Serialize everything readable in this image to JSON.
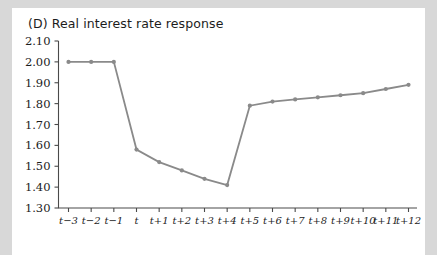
{
  "panel": {
    "label": "(D)",
    "title": "(D) Real interest rate response"
  },
  "colors": {
    "series": "#8a8a8a",
    "axis": "#4a4a4a",
    "text": "#1c1c1c",
    "plot_background": "#ffffff",
    "page_background": "#d8d8d8"
  },
  "chart_data": {
    "type": "line",
    "title": "(D) Real interest rate response",
    "xlabel": "",
    "ylabel": "",
    "grid": false,
    "legend": "none",
    "marker": "circle",
    "series_color": "#8a8a8a",
    "categories": [
      "t−3",
      "t−2",
      "t−1",
      "t",
      "t+1",
      "t+2",
      "t+3",
      "t+4",
      "t+5",
      "t+6",
      "t+7",
      "t+8",
      "t+9",
      "t+10",
      "t+11",
      "t+12"
    ],
    "values": [
      2.0,
      2.0,
      2.0,
      1.58,
      1.52,
      1.48,
      1.44,
      1.41,
      1.79,
      1.81,
      1.82,
      1.83,
      1.84,
      1.85,
      1.87,
      1.89
    ],
    "ylim": [
      1.3,
      2.1
    ],
    "ytick_labels": [
      "2.10",
      "2.00",
      "1.90",
      "1.80",
      "1.70",
      "1.60",
      "1.50",
      "1.40",
      "1.30"
    ],
    "ytick_values": [
      2.1,
      2.0,
      1.9,
      1.8,
      1.7,
      1.6,
      1.5,
      1.4,
      1.3
    ],
    "xtick_labels": [
      "t−3",
      "t−2",
      "t−1",
      "t",
      "t+1",
      "t+2",
      "t+3",
      "t+4",
      "t+5",
      "t+6",
      "t+7",
      "t+8",
      "t+9",
      "t+10",
      "t+11",
      "t+12"
    ]
  }
}
